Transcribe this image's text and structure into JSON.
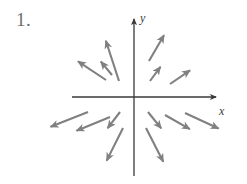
{
  "figure": {
    "problem_number": "1.",
    "type": "vector-field-diagram",
    "colors": {
      "arrow": "#808080",
      "axis": "#3a3a3a",
      "label": "#3a3a3a",
      "number": "#6e6e6e",
      "background": "#ffffff"
    }
  },
  "axes": {
    "origin": {
      "x": 134,
      "y": 97
    },
    "x_axis": {
      "label": "x",
      "label_pos": {
        "x": 223,
        "y": 113
      },
      "start": {
        "x": 72,
        "y": 97
      },
      "end": {
        "x": 222,
        "y": 97
      },
      "arrowhead": "end"
    },
    "y_axis": {
      "label": "y",
      "label_pos": {
        "x": 143,
        "y": 20
      },
      "start": {
        "x": 134,
        "y": 176
      },
      "end": {
        "x": 134,
        "y": 13
      },
      "arrowhead": "end"
    }
  },
  "chart_data": {
    "type": "vector-field",
    "title": "",
    "xlabel": "x",
    "ylabel": "y",
    "grid": false,
    "legend": null,
    "arrow_count": 14,
    "arrows": [
      {
        "id": "ul-steep",
        "quadrant": "upper-left",
        "tail": {
          "x": 119,
          "y": 81
        },
        "head": {
          "x": 104,
          "y": 35
        }
      },
      {
        "id": "ul-mid",
        "quadrant": "upper-left",
        "tail": {
          "x": 112,
          "y": 75
        },
        "head": {
          "x": 97,
          "y": 57
        }
      },
      {
        "id": "ul-shallow",
        "quadrant": "upper-left",
        "tail": {
          "x": 106,
          "y": 80
        },
        "head": {
          "x": 73,
          "y": 58
        }
      },
      {
        "id": "ur-steep",
        "quadrant": "upper-right",
        "tail": {
          "x": 149,
          "y": 61
        },
        "head": {
          "x": 167,
          "y": 30
        }
      },
      {
        "id": "ur-mid",
        "quadrant": "upper-right",
        "tail": {
          "x": 150,
          "y": 81
        },
        "head": {
          "x": 164,
          "y": 62
        }
      },
      {
        "id": "ur-shallow",
        "quadrant": "upper-right",
        "tail": {
          "x": 170,
          "y": 84
        },
        "head": {
          "x": 195,
          "y": 67
        }
      },
      {
        "id": "ll-shallow-far",
        "quadrant": "lower-left",
        "tail": {
          "x": 88,
          "y": 112
        },
        "head": {
          "x": 45,
          "y": 129
        }
      },
      {
        "id": "ll-shallow-near",
        "quadrant": "lower-left",
        "tail": {
          "x": 110,
          "y": 117
        },
        "head": {
          "x": 71,
          "y": 133
        }
      },
      {
        "id": "ll-steep-near",
        "quadrant": "lower-left",
        "tail": {
          "x": 120,
          "y": 112
        },
        "head": {
          "x": 104,
          "y": 133
        }
      },
      {
        "id": "ll-steep-far",
        "quadrant": "lower-left",
        "tail": {
          "x": 123,
          "y": 128
        },
        "head": {
          "x": 104,
          "y": 166
        }
      },
      {
        "id": "lr-steep-near",
        "quadrant": "lower-right",
        "tail": {
          "x": 148,
          "y": 112
        },
        "head": {
          "x": 165,
          "y": 133
        }
      },
      {
        "id": "lr-shallow-near",
        "quadrant": "lower-right",
        "tail": {
          "x": 165,
          "y": 115
        },
        "head": {
          "x": 195,
          "y": 132
        }
      },
      {
        "id": "lr-shallow-far",
        "quadrant": "lower-right",
        "tail": {
          "x": 185,
          "y": 113
        },
        "head": {
          "x": 224,
          "y": 131
        }
      },
      {
        "id": "lr-steep-far",
        "quadrant": "lower-right",
        "tail": {
          "x": 146,
          "y": 128
        },
        "head": {
          "x": 166,
          "y": 167
        }
      }
    ]
  }
}
